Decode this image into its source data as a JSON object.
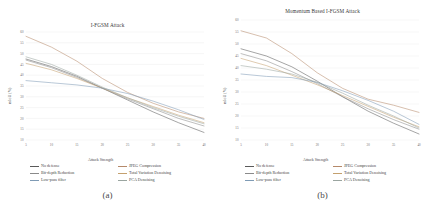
{
  "figure": {
    "panels": [
      {
        "id": "a",
        "caption": "(a)",
        "title": "I-FGSM Attack",
        "xlabel": "Attack Strength",
        "ylabel": "mIoU (%)"
      },
      {
        "id": "b",
        "caption": "(b)",
        "title": "Momentum Based I-FGSM Attack",
        "xlabel": "Attack Strength",
        "ylabel": "mIoU (%)"
      }
    ]
  },
  "legend": {
    "items": [
      {
        "label": "No defense",
        "color": "#5a5a5a"
      },
      {
        "label": "JPEG Compression",
        "color": "#b5896a"
      },
      {
        "label": "Bit-depth Reduction",
        "color": "#8a8a8a"
      },
      {
        "label": "Total Variation Denoising",
        "color": "#c4a06e"
      },
      {
        "label": "Low-pass filter",
        "color": "#7f9bb5"
      },
      {
        "label": "PCA Denoising",
        "color": "#9aa5a0"
      }
    ]
  },
  "chart_data": [
    {
      "type": "line",
      "title": "I-FGSM Attack",
      "xlabel": "Attack Strength",
      "ylabel": "mIoU (%)",
      "x": [
        5,
        10,
        15,
        20,
        25,
        30,
        35,
        40
      ],
      "xlim": [
        5,
        40
      ],
      "ylim": [
        10,
        60
      ],
      "xticks": [
        5,
        10,
        15,
        20,
        25,
        30,
        35,
        40
      ],
      "yticks": [
        10,
        15,
        20,
        25,
        30,
        35,
        40,
        45,
        50,
        55,
        60
      ],
      "grid": true,
      "legend_position": "below",
      "series": [
        {
          "name": "No defense",
          "color": "#5a5a5a",
          "values": [
            47.5,
            44.0,
            39.5,
            34.0,
            28.5,
            23.0,
            18.0,
            13.5
          ]
        },
        {
          "name": "JPEG Compression",
          "color": "#b5896a",
          "values": [
            58.0,
            53.0,
            46.5,
            38.5,
            32.0,
            27.0,
            23.0,
            20.0
          ]
        },
        {
          "name": "Bit-depth Reduction",
          "color": "#8a8a8a",
          "values": [
            47.0,
            43.5,
            39.0,
            34.0,
            29.0,
            24.5,
            20.0,
            16.5
          ]
        },
        {
          "name": "Total Variation Denoising",
          "color": "#c4a06e",
          "values": [
            45.5,
            42.5,
            38.5,
            34.0,
            29.5,
            25.5,
            21.5,
            18.0
          ]
        },
        {
          "name": "Low-pass filter",
          "color": "#7f9bb5",
          "values": [
            37.5,
            36.5,
            35.5,
            34.0,
            31.5,
            28.0,
            24.0,
            19.5
          ]
        },
        {
          "name": "PCA Denoising",
          "color": "#9aa5a0",
          "values": [
            48.5,
            45.0,
            40.0,
            34.5,
            29.5,
            25.0,
            21.0,
            17.5
          ]
        }
      ]
    },
    {
      "type": "line",
      "title": "Momentum Based I-FGSM Attack",
      "xlabel": "Attack Strength",
      "ylabel": "mIoU (%)",
      "x": [
        5,
        10,
        15,
        20,
        25,
        30,
        35,
        40
      ],
      "xlim": [
        5,
        40
      ],
      "ylim": [
        10,
        60
      ],
      "xticks": [
        5,
        10,
        15,
        20,
        25,
        30,
        35,
        40
      ],
      "yticks": [
        10,
        15,
        20,
        25,
        30,
        35,
        40,
        45,
        50,
        55,
        60
      ],
      "grid": true,
      "legend_position": "below",
      "series": [
        {
          "name": "No defense",
          "color": "#5a5a5a",
          "values": [
            48.0,
            45.0,
            40.5,
            34.5,
            28.0,
            22.0,
            17.0,
            12.5
          ]
        },
        {
          "name": "JPEG Compression",
          "color": "#b5896a",
          "values": [
            55.5,
            52.5,
            46.0,
            38.0,
            31.5,
            27.0,
            24.5,
            21.5
          ]
        },
        {
          "name": "Bit-depth Reduction",
          "color": "#8a8a8a",
          "values": [
            46.0,
            43.0,
            38.5,
            33.5,
            28.0,
            23.0,
            18.5,
            14.5
          ]
        },
        {
          "name": "Total Variation Denoising",
          "color": "#c4a06e",
          "values": [
            44.0,
            41.0,
            37.0,
            33.0,
            28.5,
            24.0,
            19.5,
            15.5
          ]
        },
        {
          "name": "Low-pass filter",
          "color": "#7f9bb5",
          "values": [
            37.5,
            36.5,
            36.0,
            34.0,
            30.5,
            26.5,
            22.0,
            16.5
          ]
        },
        {
          "name": "PCA Denoising",
          "color": "#9aa5a0",
          "values": [
            41.0,
            39.5,
            37.5,
            34.0,
            29.5,
            24.5,
            20.0,
            15.0
          ]
        }
      ]
    }
  ]
}
